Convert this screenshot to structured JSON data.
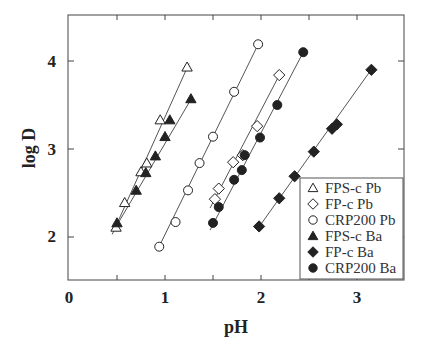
{
  "chart_data": {
    "type": "scatter",
    "title": "",
    "xlabel": "pH",
    "ylabel": "log D",
    "xlim": [
      0,
      3.5
    ],
    "ylim": [
      1.5,
      4.5
    ],
    "xticks": [
      0,
      1,
      2,
      3
    ],
    "xticks_minor": [
      0.5,
      1.5,
      2.5
    ],
    "yticks": [
      2,
      3,
      4
    ],
    "grid": false,
    "legend_position": "lower right",
    "series": [
      {
        "name": "FPS-c  Pb",
        "marker": "triangle",
        "filled": false,
        "x": [
          0.49,
          0.58,
          0.75,
          0.81,
          0.95,
          1.23
        ],
        "y": [
          2.11,
          2.39,
          2.74,
          2.84,
          3.33,
          3.93
        ],
        "fit": [
          [
            0.45,
            2.03
          ],
          [
            1.25,
            3.97
          ]
        ]
      },
      {
        "name": "FP-c Pb",
        "marker": "diamond",
        "filled": false,
        "x": [
          1.52,
          1.56,
          1.71,
          1.81,
          1.96,
          2.19
        ],
        "y": [
          2.43,
          2.55,
          2.85,
          2.93,
          3.26,
          3.84
        ],
        "fit": [
          [
            1.47,
            2.33
          ],
          [
            2.21,
            3.88
          ]
        ]
      },
      {
        "name": "CRP200 Pb",
        "marker": "circle",
        "filled": false,
        "x": [
          0.94,
          1.11,
          1.24,
          1.36,
          1.5,
          1.72,
          1.97
        ],
        "y": [
          1.89,
          2.17,
          2.53,
          2.84,
          3.14,
          3.65,
          4.19
        ],
        "fit": [
          [
            0.92,
            1.85
          ],
          [
            1.98,
            4.21
          ]
        ]
      },
      {
        "name": "FPS-c Ba",
        "marker": "triangle",
        "filled": true,
        "x": [
          0.5,
          0.7,
          0.8,
          0.9,
          1.0,
          1.05,
          1.27
        ],
        "y": [
          2.16,
          2.53,
          2.73,
          2.92,
          3.14,
          3.33,
          3.57
        ],
        "fit": [
          [
            0.47,
            2.08
          ],
          [
            1.29,
            3.6
          ]
        ]
      },
      {
        "name": "FP-c Ba",
        "marker": "diamond",
        "filled": true,
        "x": [
          1.98,
          2.19,
          2.35,
          2.55,
          2.74,
          2.79,
          3.15
        ],
        "y": [
          2.12,
          2.44,
          2.69,
          2.97,
          3.23,
          3.28,
          3.9
        ],
        "fit": [
          [
            1.97,
            2.1
          ],
          [
            3.16,
            3.92
          ]
        ]
      },
      {
        "name": "CRP200 Ba",
        "marker": "circle",
        "filled": true,
        "x": [
          1.5,
          1.56,
          1.72,
          1.8,
          1.83,
          1.99,
          2.17,
          2.44
        ],
        "y": [
          2.16,
          2.34,
          2.65,
          2.76,
          2.93,
          3.13,
          3.5,
          4.1
        ],
        "fit": [
          [
            1.47,
            2.08
          ],
          [
            2.45,
            4.12
          ]
        ]
      }
    ]
  },
  "colors": {
    "ink": "#222222",
    "line": "#555555",
    "frame": "#444444",
    "background": "#ffffff"
  }
}
